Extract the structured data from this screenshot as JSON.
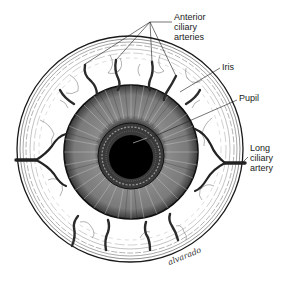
{
  "figure": {
    "colors": {
      "ink": "#1a1a1a",
      "pupil": "#000000",
      "iris_tone": "#6e6e6e",
      "sclera": "#ffffff",
      "background": "#ffffff"
    }
  },
  "labels": {
    "anterior_ciliary_arteries": {
      "line1": "Anterior",
      "line2": "ciliary",
      "line3": "arteries"
    },
    "iris": {
      "text": "Iris"
    },
    "pupil": {
      "text": "Pupil"
    },
    "long_ciliary_artery": {
      "line1": "Long",
      "line2": "ciliary",
      "line3": "artery"
    }
  },
  "signature": {
    "text": "alvarado"
  }
}
